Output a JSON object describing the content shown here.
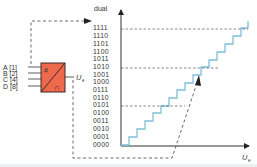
{
  "diagram": {
    "y_axis_label": "dual",
    "x_axis_label": "U",
    "x_axis_label_sub": "e",
    "block_output_label": "U",
    "block_output_label_sub": "e",
    "block_symbol_top": "#",
    "block_symbol_bottom": "∩",
    "inputs": [
      {
        "label": "A [1]"
      },
      {
        "label": "B [2]"
      },
      {
        "label": "C [4]"
      },
      {
        "label": "D [8]"
      }
    ],
    "codes": [
      "1111",
      "1110",
      "1101",
      "1100",
      "1011",
      "1010",
      "1001",
      "1000",
      "0111",
      "0110",
      "0101",
      "0100",
      "0011",
      "0010",
      "0001",
      "0000"
    ],
    "colors": {
      "block_fill": "#ef6a4c",
      "block_stroke": "#3a2a26",
      "staircase": "#7fbfdc",
      "axis": "#333333",
      "dashed": "#444444"
    }
  }
}
